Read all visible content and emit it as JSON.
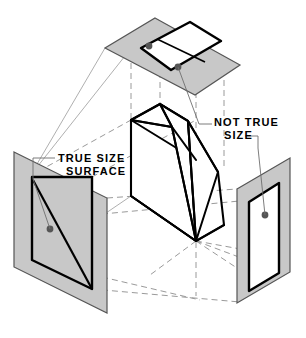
{
  "figure": {
    "type": "technical-isometric-drawing",
    "canvas": {
      "width": 306,
      "height": 338,
      "background": "#ffffff"
    },
    "colors": {
      "plane_fill": "#c8c8c8",
      "plane_edge": "#555555",
      "view_outline": "#000000",
      "object_outline": "#000000",
      "object_fill": "#ffffff",
      "projector_dashed": "#9a9a9a",
      "leader_line": "#6e6e6e",
      "marker_dot": "#555555",
      "text": "#000000"
    }
  },
  "labels": {
    "true_size": {
      "line1": "TRUE SIZE",
      "line2": "SURFACE",
      "x1": 58,
      "y1": 161,
      "x2": 66,
      "y2": 173,
      "target_view": "left-profile-plane"
    },
    "not_true_size": {
      "line1": "NOT TRUE",
      "line2": "SIZE",
      "x1": 214,
      "y1": 124,
      "x2": 222,
      "y2": 136,
      "target_views": "top-plane and right-profile-plane"
    }
  },
  "planes": [
    {
      "name": "top-projection-plane",
      "id": "plane-top",
      "orientation": "horizontal",
      "fill": "#c8c8c8",
      "outline_points": "155,18 240,65 195,95 105,48",
      "view_outline_points": "141,48 190,23 219,40 220,41 221,41 219,43 169,72 139,51",
      "view_label": "NOT TRUE SIZE",
      "markers": [
        {
          "cx": 149,
          "cy": 46,
          "r": 3.4
        },
        {
          "cx": 178,
          "cy": 67,
          "r": 3.4
        }
      ]
    },
    {
      "name": "left-profile-plane",
      "id": "plane-left",
      "orientation": "vertical-left",
      "fill": "#c8c8c8",
      "outline_points": "14,152 107,198 107,313 14,267",
      "view_outline_points": "32,177 92,177 92,289 32,260",
      "view_label": "TRUE SIZE SURFACE",
      "markers": [
        {
          "cx": 50,
          "cy": 229,
          "r": 3.4
        }
      ]
    },
    {
      "name": "right-profile-plane",
      "id": "plane-right",
      "orientation": "vertical-right",
      "fill": "#c8c8c8",
      "outline_points": "237,189 290,158 290,272 237,303",
      "view_outline_points": "249,200 279,182 279,272 249,290",
      "view_label": "NOT TRUE SIZE",
      "markers": [
        {
          "cx": 265,
          "cy": 215,
          "r": 3.4
        }
      ]
    }
  ],
  "object": {
    "name": "wedge-block",
    "fill": "#ffffff",
    "outline": "#000000",
    "description": "Inclined-surface wedge shown in isometric between the three projection planes"
  },
  "projectors": {
    "description": "Grey dashed projector lines linking object vertices to their projected views",
    "style": "dashed"
  }
}
